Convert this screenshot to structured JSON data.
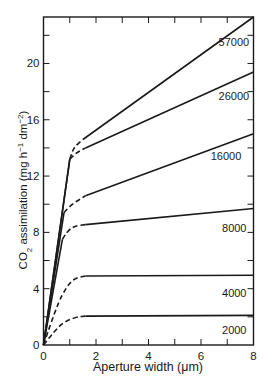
{
  "chart_data": {
    "type": "line",
    "title": "",
    "xlabel": "Aperture width (μm)",
    "ylabel": "CO₂ assimilation (mg h⁻¹ dm⁻²)",
    "ylabel_parts": {
      "main": "CO",
      "sub": "2",
      "rest": " assimilation (mg h",
      "sup1": "−1",
      "mid": " dm",
      "sup2": "−2",
      "end": ")"
    },
    "xlim": [
      0,
      8
    ],
    "ylim": [
      0,
      23.3
    ],
    "x_ticks": [
      0,
      2,
      4,
      6,
      8
    ],
    "x_tick_labels": [
      "0",
      "2",
      "4",
      "6",
      "8"
    ],
    "x_minor_ticks": [
      1,
      3,
      5,
      7
    ],
    "y_ticks": [
      0,
      4,
      8,
      12,
      16,
      20
    ],
    "y_tick_labels": [
      "0",
      "4",
      "8",
      "12",
      "16",
      "20"
    ],
    "y_minor_ticks": [
      2,
      6,
      10,
      14,
      18,
      22
    ],
    "grid": false,
    "legend": "inline labels at right end of each curve",
    "series_note": "Curves labelled by light intensity / parameter; solid = measured-linear segments, dashed = transition region",
    "series": [
      {
        "name": "57000",
        "label_pos": [
          7.3,
          21.5
        ],
        "solid_initial": [
          [
            0,
            0
          ],
          [
            1.0,
            13.2
          ]
        ],
        "dashed": [
          [
            1.0,
            13.2
          ],
          [
            1.1,
            13.8
          ],
          [
            1.25,
            14.2
          ],
          [
            1.5,
            14.6
          ]
        ],
        "solid_final": [
          [
            1.5,
            14.6
          ],
          [
            8,
            23.3
          ]
        ]
      },
      {
        "name": "26000",
        "label_pos": [
          7.3,
          17.7
        ],
        "solid_initial": [
          [
            0,
            0
          ],
          [
            1.0,
            13.2
          ]
        ],
        "dashed": [
          [
            1.0,
            13.2
          ],
          [
            1.2,
            13.6
          ],
          [
            1.6,
            14.0
          ]
        ],
        "solid_final": [
          [
            1.6,
            14.0
          ],
          [
            8,
            19.4
          ]
        ]
      },
      {
        "name": "16000",
        "label_pos": [
          7.0,
          13.4
        ],
        "solid_initial": [
          [
            0,
            0
          ],
          [
            0.78,
            9.4
          ]
        ],
        "dashed": [
          [
            0.78,
            9.4
          ],
          [
            1.0,
            9.9
          ],
          [
            1.6,
            10.6
          ]
        ],
        "solid_final": [
          [
            1.6,
            10.6
          ],
          [
            8,
            15.0
          ]
        ]
      },
      {
        "name": "8000",
        "label_pos": [
          7.2,
          8.3
        ],
        "solid_initial": [
          [
            0,
            0
          ],
          [
            0.72,
            7.5
          ]
        ],
        "dashed": [
          [
            0.72,
            7.5
          ],
          [
            0.9,
            8.1
          ],
          [
            1.2,
            8.45
          ],
          [
            1.6,
            8.55
          ]
        ],
        "solid_final": [
          [
            1.6,
            8.55
          ],
          [
            8,
            9.7
          ]
        ]
      },
      {
        "name": "4000",
        "label_pos": [
          7.2,
          3.7
        ],
        "solid_initial": [],
        "dashed": [
          [
            0,
            0
          ],
          [
            0.5,
            2.8
          ],
          [
            0.9,
            4.2
          ],
          [
            1.2,
            4.75
          ],
          [
            1.6,
            4.9
          ]
        ],
        "solid_final": [
          [
            1.6,
            4.9
          ],
          [
            8,
            4.95
          ]
        ]
      },
      {
        "name": "2000",
        "label_pos": [
          7.2,
          1.05
        ],
        "solid_initial": [],
        "dashed": [
          [
            0,
            0
          ],
          [
            0.5,
            1.2
          ],
          [
            0.9,
            1.75
          ],
          [
            1.3,
            2.0
          ],
          [
            1.6,
            2.05
          ]
        ],
        "solid_final": [
          [
            1.6,
            2.05
          ],
          [
            8,
            2.1
          ]
        ]
      }
    ]
  }
}
